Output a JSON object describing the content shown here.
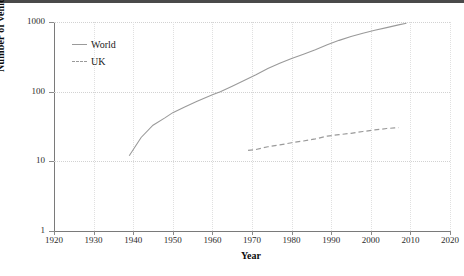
{
  "chart_data": {
    "type": "line",
    "title": "",
    "xlabel": "Year",
    "ylabel": "Number of vehicles (Millions)",
    "xlim": [
      1920,
      2020
    ],
    "ylim": [
      1,
      1000
    ],
    "yscale": "log",
    "grid": true,
    "legend_position": "inside-top-left",
    "xticks": [
      1920,
      1930,
      1940,
      1950,
      1960,
      1970,
      1980,
      1990,
      2000,
      2010,
      2020
    ],
    "xtick_labels": [
      "1920",
      "1930",
      "1940",
      "1950",
      "1960",
      "1970",
      "1980",
      "1990",
      "2000",
      "2010",
      "2020"
    ],
    "yticks": [
      1,
      10,
      100,
      1000
    ],
    "ytick_labels": [
      "1",
      "10",
      "100",
      "1000"
    ],
    "series": [
      {
        "name": "World",
        "style": "solid",
        "color": "#9a9a9a",
        "x": [
          1939,
          1942,
          1945,
          1948,
          1950,
          1953,
          1956,
          1960,
          1962,
          1965,
          1968,
          1971,
          1974,
          1977,
          1980,
          1983,
          1986,
          1989,
          1992,
          1995,
          1998,
          2001,
          2004,
          2007,
          2009
        ],
        "y": [
          12,
          22,
          33,
          42,
          50,
          60,
          72,
          90,
          100,
          120,
          145,
          175,
          215,
          255,
          300,
          345,
          400,
          470,
          545,
          620,
          690,
          760,
          830,
          910,
          960
        ]
      },
      {
        "name": "UK",
        "style": "dashed",
        "color": "#9a9a9a",
        "x": [
          1969,
          1971,
          1974,
          1977,
          1980,
          1983,
          1986,
          1989,
          1992,
          1995,
          1998,
          2001,
          2004,
          2006,
          2007
        ],
        "y": [
          14.4,
          14.8,
          16.2,
          17.2,
          18.5,
          19.6,
          21.0,
          23.0,
          24.2,
          25.2,
          26.8,
          28.2,
          29.6,
          30.2,
          30.4
        ]
      }
    ]
  },
  "legend": {
    "items": [
      {
        "label": "World",
        "style": "solid"
      },
      {
        "label": "UK",
        "style": "dashed"
      }
    ]
  },
  "axes": {
    "y_title": "Number of vehicles (Millions)",
    "x_title": "Year"
  }
}
